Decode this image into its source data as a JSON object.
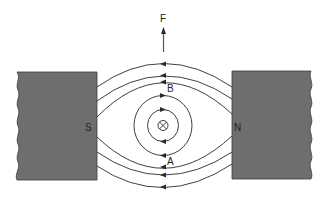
{
  "diagram": {
    "labels": {
      "force": "F",
      "point_b": "B",
      "point_a": "A",
      "south_pole": "S",
      "north_pole": "N"
    },
    "conductor": {
      "symbol": "cross-in-circle",
      "meaning": "current into page"
    },
    "colors": {
      "magnet_fill": "#6e6e6e",
      "magnet_stroke": "#3a3a3a",
      "line": "#2a2a2a",
      "background": "#ffffff"
    },
    "field_lines": {
      "direction": "N to S (right to left)",
      "upper_count": 3,
      "lower_count": 3
    },
    "conductor_field": {
      "circles": 2,
      "direction": "clockwise"
    }
  }
}
